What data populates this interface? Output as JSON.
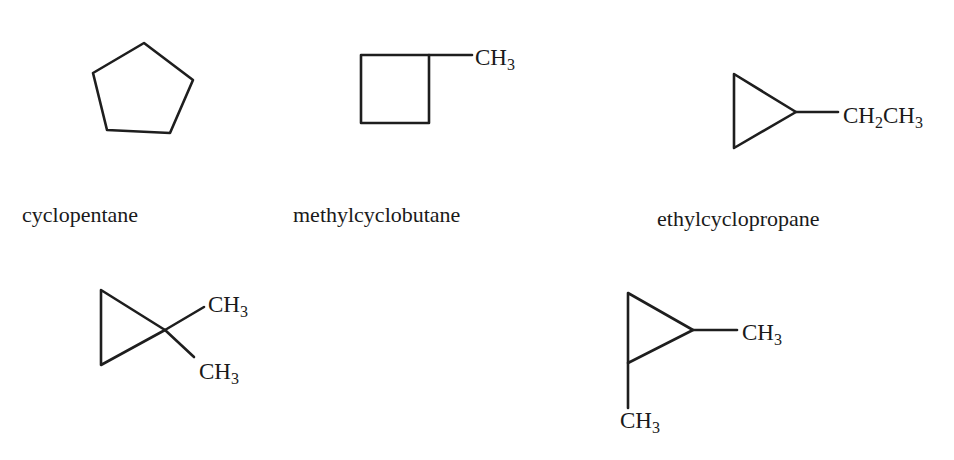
{
  "figure": {
    "stroke_color": "#1e1e1e",
    "text_color": "#1a1a1a",
    "background": "#ffffff"
  },
  "molecules": [
    {
      "id": "cyclopentane",
      "name": "cyclopentane",
      "ring": "pentagon",
      "substituents": []
    },
    {
      "id": "methylcyclobutane",
      "name": "methylcyclobutane",
      "ring": "square",
      "substituents": [
        {
          "label_main": "CH",
          "label_sub": "3"
        }
      ]
    },
    {
      "id": "ethylcyclopropane",
      "name": "ethylcyclopropane",
      "ring": "triangle",
      "substituents": [
        {
          "label_main1": "CH",
          "label_sub1": "2",
          "label_main2": "CH",
          "label_sub2": "3"
        }
      ]
    },
    {
      "id": "1,1-dimethylcyclopropane",
      "name": "",
      "ring": "triangle",
      "substituents": [
        {
          "label_main": "CH",
          "label_sub": "3"
        },
        {
          "label_main": "CH",
          "label_sub": "3"
        }
      ]
    },
    {
      "id": "1,2-dimethylcyclopropane",
      "name": "",
      "ring": "triangle",
      "substituents": [
        {
          "label_main": "CH",
          "label_sub": "3"
        },
        {
          "label_main": "CH",
          "label_sub": "3"
        }
      ]
    }
  ]
}
